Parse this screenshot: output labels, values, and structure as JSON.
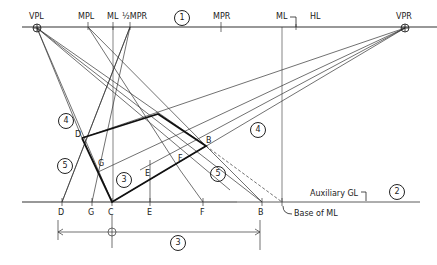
{
  "horizon_line": {
    "labels": {
      "vpl": "VPL",
      "mpl": "MPL",
      "ml": "ML",
      "half_mpr": "½MPR",
      "step1": "1",
      "mpr": "MPR",
      "ml2": "ML",
      "hl": "HL",
      "vpr": "VPR"
    }
  },
  "ground_line": {
    "labels": {
      "d": "D",
      "g": "G",
      "c": "C",
      "e": "E",
      "f": "F",
      "b": "B",
      "base_of_ml": "Base of ML",
      "aux_gl": "Auxiliary GL",
      "step2": "2"
    }
  },
  "figure": {
    "points": {
      "d": "D",
      "b": "B",
      "g": "G",
      "e": "E",
      "f": "F"
    },
    "steps": {
      "step3_inner": "3",
      "step4_left": "4",
      "step4_right": "4",
      "step5_left": "5",
      "step5_right": "5"
    }
  },
  "dimension": {
    "step3_bottom": "3"
  },
  "colors": {
    "ink": "#222222",
    "light_ink": "#555555",
    "background": "#ffffff"
  }
}
